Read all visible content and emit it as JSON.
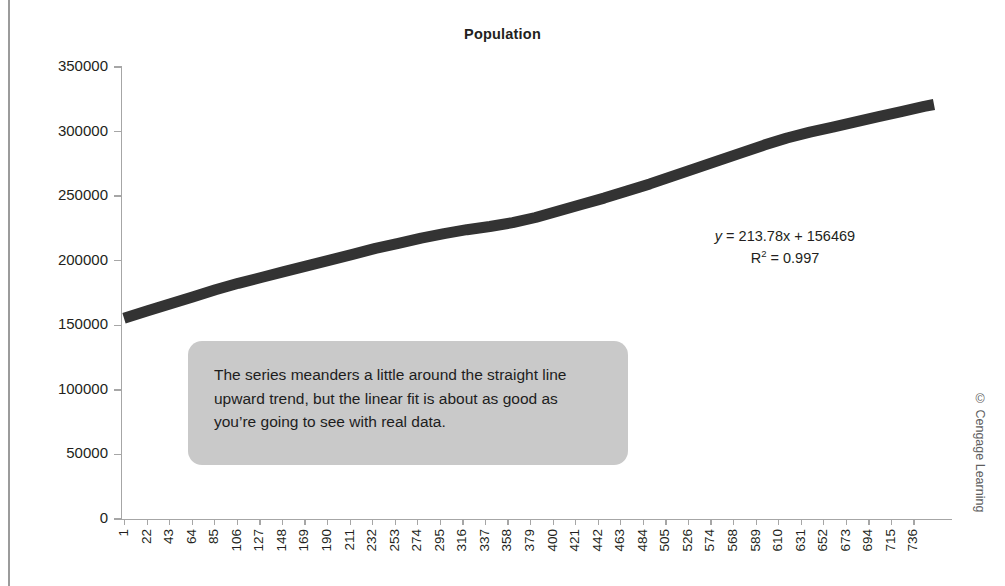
{
  "figure": {
    "credit": "© Cengage Learning"
  },
  "annotations": {
    "equation_line1_prefix": "y",
    "equation_line1_rest": " = 213.78x + 156469",
    "equation_r2_prefix": "R",
    "equation_r2_sup": "2",
    "equation_r2_rest": " = 0.997",
    "callout_text": "The series meanders a little around the straight line upward trend, but the linear fit is about as good as you’re going to see with real data."
  },
  "chart_data": {
    "type": "line",
    "title": "Population",
    "xlabel": "",
    "ylabel": "",
    "ylim": [
      0,
      350000
    ],
    "yticks": [
      0,
      50000,
      100000,
      150000,
      200000,
      250000,
      300000,
      350000
    ],
    "ytick_labels": [
      "0",
      "50000",
      "100000",
      "150000",
      "200000",
      "250000",
      "300000",
      "350000"
    ],
    "grid": false,
    "legend": false,
    "xtick_labels": [
      "1",
      "22",
      "43",
      "64",
      "85",
      "106",
      "127",
      "148",
      "169",
      "190",
      "211",
      "232",
      "253",
      "274",
      "295",
      "316",
      "337",
      "358",
      "379",
      "400",
      "421",
      "442",
      "463",
      "484",
      "505",
      "526",
      "574",
      "568",
      "589",
      "610",
      "631",
      "652",
      "673",
      "694",
      "715",
      "736"
    ],
    "series": [
      {
        "name": "Population",
        "color": "#333333",
        "line_width": 11,
        "x": [
          1,
          22,
          43,
          64,
          85,
          106,
          127,
          148,
          169,
          190,
          211,
          232,
          253,
          274,
          295,
          316,
          337,
          358,
          379,
          400,
          421,
          442,
          463,
          484,
          505,
          526,
          547,
          568,
          589,
          610,
          631,
          652,
          673,
          694,
          715,
          736,
          745
        ],
        "values": [
          155500,
          161000,
          166500,
          172000,
          177500,
          182500,
          187000,
          191500,
          196000,
          200500,
          205000,
          209500,
          213500,
          217500,
          221000,
          224000,
          226500,
          229500,
          233500,
          238500,
          243500,
          248500,
          254000,
          259500,
          265500,
          271500,
          277500,
          283500,
          289500,
          295000,
          299500,
          303500,
          307500,
          311500,
          315500,
          319500,
          321000
        ]
      }
    ],
    "trendline": {
      "shown": false,
      "slope": 213.78,
      "intercept": 156469,
      "r_squared": 0.997,
      "equation": "y = 213.78x + 156469"
    }
  }
}
